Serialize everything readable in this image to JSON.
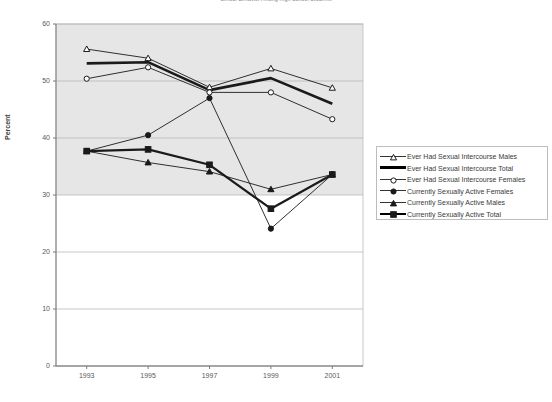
{
  "chart_title": "Sexual Behavior Among High School Students",
  "axes": {
    "ylabel": "Percent",
    "xlabel": "",
    "y_ticks": [
      "0",
      "10",
      "20",
      "30",
      "40",
      "50",
      "60"
    ],
    "x_ticks": [
      "1993",
      "1995",
      "1997",
      "1999",
      "2001"
    ]
  },
  "legend": {
    "items": [
      {
        "label": "Ever Had Sexual Intercourse Males",
        "marker": "triangle-open",
        "width": "thin"
      },
      {
        "label": "Ever Had Sexual Intercourse Total",
        "marker": "none",
        "width": "thick"
      },
      {
        "label": "Ever Had Sexual Intercourse Females",
        "marker": "circle-open",
        "width": "thin"
      },
      {
        "label": "Currently Sexually Active Females",
        "marker": "circle-filled",
        "width": "thin"
      },
      {
        "label": "Currently Sexually Active Males",
        "marker": "triangle-filled",
        "width": "thin"
      },
      {
        "label": "Currently Sexually Active Total",
        "marker": "square-filled",
        "width": "med"
      }
    ]
  },
  "colors": {
    "plot_band": "#e6e6e6",
    "plot_white": "#ffffff",
    "gridline": "#b0b0b0",
    "axis": "#7a7a7a",
    "series": "#1a1a1a",
    "text": "#4a4a4a"
  },
  "chart_data": {
    "type": "line",
    "title": "Sexual Behavior Among High School Students",
    "xlabel": "",
    "ylabel": "Percent",
    "ylim": [
      0,
      60
    ],
    "grid": true,
    "legend_position": "right",
    "categories": [
      "1993",
      "1995",
      "1997",
      "1999",
      "2001"
    ],
    "series": [
      {
        "name": "Ever Had Sexual Intercourse Males",
        "marker": "triangle-open",
        "values": [
          55.6,
          54.0,
          48.9,
          52.2,
          48.8
        ]
      },
      {
        "name": "Ever Had Sexual Intercourse Total",
        "marker": "none",
        "values": [
          53.1,
          53.3,
          48.4,
          50.5,
          46.0
        ]
      },
      {
        "name": "Ever Had Sexual Intercourse Females",
        "marker": "circle-open",
        "values": [
          50.4,
          52.4,
          48.0,
          48.0,
          43.3
        ]
      },
      {
        "name": "Currently Sexually Active Females",
        "marker": "circle-filled",
        "values": [
          37.7,
          40.5,
          47.0,
          24.1,
          33.6
        ]
      },
      {
        "name": "Currently Sexually Active Males",
        "marker": "triangle-filled",
        "values": [
          37.7,
          35.7,
          34.1,
          31.0,
          33.6
        ]
      },
      {
        "name": "Currently Sexually Active Total",
        "marker": "square-filled",
        "values": [
          37.7,
          38.0,
          35.3,
          27.6,
          33.6
        ]
      }
    ]
  }
}
